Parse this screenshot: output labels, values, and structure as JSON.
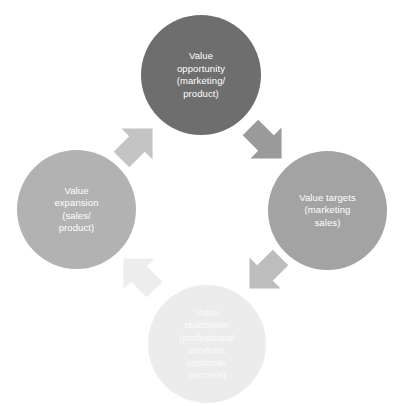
{
  "diagram": {
    "type": "cycle-diagram",
    "background_color": "#ffffff",
    "nodes": [
      {
        "id": "opportunity",
        "label": "Value\nopportunity\n(marketing/\nproduct)",
        "position": "top",
        "color": "#6e6e6e",
        "text_color": "#ffffff"
      },
      {
        "id": "targets",
        "label": "Value targets\n(marketing\nsales)",
        "position": "right",
        "color": "#a3a3a3",
        "text_color": "#ffffff"
      },
      {
        "id": "realization",
        "label": "Value\nrealization\n(professional\nservices,\ncustomer\nsuccess)",
        "position": "bottom",
        "color": "#ececec",
        "text_color": "#fbfbfb"
      },
      {
        "id": "expansion",
        "label": "Value\nexpansion\n(sales/\nproduct)",
        "position": "left",
        "color": "#b2b2b2",
        "text_color": "#ffffff"
      }
    ],
    "arrows": [
      {
        "id": "top-right",
        "from": "opportunity",
        "to": "targets",
        "direction": "down-right",
        "color": "#9a9a9a"
      },
      {
        "id": "bottom-right",
        "from": "targets",
        "to": "realization",
        "direction": "down-left",
        "color": "#bdbdbd"
      },
      {
        "id": "bottom-left",
        "from": "realization",
        "to": "expansion",
        "direction": "up-left",
        "color": "#ededed"
      },
      {
        "id": "top-left",
        "from": "expansion",
        "to": "opportunity",
        "direction": "up-right",
        "color": "#c4c4c4"
      }
    ]
  }
}
